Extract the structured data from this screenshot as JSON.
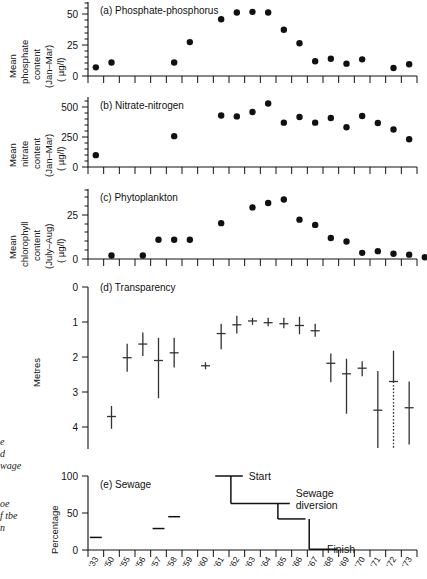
{
  "figure": {
    "kind": "multi-panel-time-series",
    "x_axis": {
      "tick_labels": [
        "1933",
        "1950",
        "1955",
        "1956",
        "1957",
        "1958",
        "1959",
        "1960",
        "1961",
        "1962",
        "1963",
        "1964",
        "1965",
        "1966",
        "1967",
        "1968",
        "1969",
        "1970",
        "1971",
        "1972",
        "1973"
      ],
      "short_labels": [
        "'33",
        "'50",
        "'55",
        "'56",
        "'57",
        "'58",
        "'59",
        "'60",
        "'61",
        "'62",
        "'63",
        "'64",
        "'65",
        "'66",
        "'67",
        "'68",
        "'69",
        "'70",
        "'71",
        "'72",
        "'73"
      ]
    },
    "margin_notes": [
      "e",
      "d",
      "wage",
      "oe",
      "f tbe",
      "n"
    ]
  },
  "chart_data": [
    {
      "type": "scatter",
      "panel": "a",
      "title": "(a) Phosphate-phosphorus",
      "ylabel": "Mean phosphate content (Jan-Mar) ( µg/l)",
      "ylabel_lines": [
        "Mean",
        "phosphate",
        "content",
        "(Jan–Mar)",
        "( µg/l)"
      ],
      "ylim": [
        0,
        60
      ],
      "yticks": [
        0,
        25,
        50
      ],
      "ytick_labels": [
        "0",
        "25",
        "50"
      ],
      "x": [
        "1933",
        "1950",
        "1955",
        "1956",
        "1957",
        "1958",
        "1959",
        "1960",
        "1961",
        "1962",
        "1963",
        "1964",
        "1965",
        "1966",
        "1967",
        "1968",
        "1969",
        "1970",
        "1971",
        "1972",
        "1973"
      ],
      "values": [
        7,
        11,
        null,
        null,
        null,
        11,
        27.5,
        null,
        46,
        51.5,
        52,
        51.5,
        37.5,
        26.5,
        12,
        14,
        10,
        13.5,
        null,
        6.5,
        9.5
      ]
    },
    {
      "type": "scatter",
      "panel": "b",
      "title": "(b) Nitrate-nitrogen",
      "ylabel": "Mean nitrate content (Jan-Mar) ( µg/l)",
      "ylabel_lines": [
        "Mean",
        "nitrate",
        "content",
        "(Jan–Mar)",
        "( µg/l)"
      ],
      "ylim": [
        0,
        560
      ],
      "yticks": [
        0,
        250,
        500
      ],
      "ytick_labels": [
        "0",
        "250",
        "500"
      ],
      "x": [
        "1933",
        "1950",
        "1955",
        "1956",
        "1957",
        "1958",
        "1959",
        "1960",
        "1961",
        "1962",
        "1963",
        "1964",
        "1965",
        "1966",
        "1967",
        "1968",
        "1969",
        "1970",
        "1971",
        "1972",
        "1973"
      ],
      "values": [
        95,
        null,
        null,
        null,
        null,
        247,
        null,
        null,
        412,
        405,
        440,
        508,
        355,
        400,
        355,
        392,
        318,
        408,
        352,
        300,
        222
      ]
    },
    {
      "type": "scatter",
      "panel": "c",
      "title": "(c) Phytoplankton",
      "ylabel": "Mean chlorophyll content (July-Aug) ( µg/l)",
      "ylabel_lines": [
        "Mean",
        "chlorophyll",
        "content",
        "(July–Aug)",
        "( µg/l)"
      ],
      "ylim": [
        0,
        40
      ],
      "yticks": [
        0,
        25
      ],
      "ytick_labels": [
        "0",
        "25"
      ],
      "x": [
        "1933",
        "1950",
        "1955",
        "1956",
        "1957",
        "1958",
        "1959",
        "1960",
        "1961",
        "1962",
        "1963",
        "1964",
        "1965",
        "1966",
        "1967",
        "1968",
        "1969",
        "1970",
        "1971",
        "1972",
        "1973"
      ],
      "values": [
        null,
        2,
        null,
        2,
        11,
        11,
        11,
        null,
        20.5,
        null,
        29.5,
        32,
        34,
        22.5,
        19.5,
        12,
        10,
        3.5,
        4.5,
        3,
        2.5,
        1
      ]
    },
    {
      "type": "errorbar",
      "panel": "d",
      "title": "(d) Transparency",
      "ylabel": "Metres",
      "ylim": [
        0,
        4.6
      ],
      "yticks": [
        0,
        1,
        2,
        3,
        4
      ],
      "ytick_labels": [
        "0",
        "1",
        "2",
        "3",
        "4"
      ],
      "y_inverted": true,
      "x": [
        "1933",
        "1950",
        "1955",
        "1956",
        "1957",
        "1958",
        "1959",
        "1960",
        "1961",
        "1962",
        "1963",
        "1964",
        "1965",
        "1966",
        "1967",
        "1968",
        "1969",
        "1970",
        "1971",
        "1972",
        "1973"
      ],
      "points": [
        {
          "x": "1950",
          "mean": 3.7,
          "low": 3.4,
          "high": 4.05
        },
        {
          "x": "1955",
          "mean": 2.02,
          "low": 1.62,
          "high": 2.42
        },
        {
          "x": "1956",
          "mean": 1.63,
          "low": 1.3,
          "high": 1.97
        },
        {
          "x": "1957",
          "mean": 2.1,
          "low": 1.45,
          "high": 3.18
        },
        {
          "x": "1958",
          "mean": 1.88,
          "low": 1.45,
          "high": 2.3
        },
        {
          "x": "1960",
          "mean": 2.25,
          "low": 2.15,
          "high": 2.35
        },
        {
          "x": "1961",
          "mean": 1.33,
          "low": 1.05,
          "high": 1.78
        },
        {
          "x": "1962",
          "mean": 1.08,
          "low": 0.82,
          "high": 1.33
        },
        {
          "x": "1963",
          "mean": 0.97,
          "low": 0.88,
          "high": 1.08
        },
        {
          "x": "1964",
          "mean": 1.02,
          "low": 0.88,
          "high": 1.12
        },
        {
          "x": "1965",
          "mean": 1.05,
          "low": 0.88,
          "high": 1.18
        },
        {
          "x": "1966",
          "mean": 1.1,
          "low": 0.85,
          "high": 1.35
        },
        {
          "x": "1967",
          "mean": 1.25,
          "low": 1.05,
          "high": 1.42
        },
        {
          "x": "1968",
          "mean": 2.18,
          "low": 1.9,
          "high": 2.72
        },
        {
          "x": "1969",
          "mean": 2.48,
          "low": 2.05,
          "high": 3.62
        },
        {
          "x": "1970",
          "mean": 2.32,
          "low": 2.12,
          "high": 2.55
        },
        {
          "x": "1971",
          "mean": 3.52,
          "low": 2.4,
          "high": 4.6
        },
        {
          "x": "1972",
          "mean": 2.7,
          "low": 1.82,
          "high": 4.6,
          "dotted_below": true
        },
        {
          "x": "1973",
          "mean": 3.45,
          "low": 2.7,
          "high": 4.5
        }
      ]
    },
    {
      "type": "step",
      "panel": "e",
      "title": "(e) Sewage",
      "ylabel": "Percentage",
      "ylim": [
        0,
        110
      ],
      "yticks": [
        0,
        50,
        100
      ],
      "ytick_labels": [
        "0",
        "50",
        "100"
      ],
      "x": [
        "1933",
        "1950",
        "1955",
        "1956",
        "1957",
        "1958",
        "1959",
        "1960",
        "1961",
        "1962",
        "1963",
        "1964",
        "1965",
        "1966",
        "1967",
        "1968",
        "1969",
        "1970",
        "1971",
        "1972",
        "1973"
      ],
      "segments": [
        {
          "from": "1933",
          "to": "1933",
          "value": 17
        },
        {
          "from": "1957",
          "to": "1957",
          "value": 29
        },
        {
          "from": "1958",
          "to": "1958",
          "value": 45
        },
        {
          "from": "1961",
          "to": "1962",
          "value": 100
        },
        {
          "from": "1962",
          "to": "1965",
          "value": 63
        },
        {
          "from": "1965",
          "to": "1966",
          "value": 42
        },
        {
          "from": "1967",
          "to": "1968",
          "value": 1
        }
      ],
      "annotations": [
        {
          "label": "Start",
          "x": "1962",
          "y": 100
        },
        {
          "label": "Sewage diversion",
          "lines": [
            "Sewage",
            "diversion"
          ],
          "x": "1965",
          "y": 63
        },
        {
          "label": "Finish",
          "x": "1967",
          "y": 1
        }
      ]
    }
  ]
}
